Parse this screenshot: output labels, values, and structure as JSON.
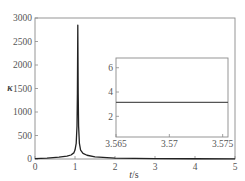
{
  "chart_data": [
    {
      "type": "line",
      "role": "main",
      "title": "",
      "xlabel_italic": "t",
      "xlabel_unit": "/s",
      "xlabel": "t/s",
      "ylabel": "κ",
      "xlim": [
        0,
        5
      ],
      "ylim": [
        0,
        3000
      ],
      "xticks": [
        0,
        1,
        2,
        3,
        4,
        5
      ],
      "xtick_labels": [
        "0",
        "1",
        "2",
        "3",
        "4",
        "5"
      ],
      "yticks": [
        0,
        500,
        1000,
        1500,
        2000,
        2500,
        3000
      ],
      "ytick_labels": [
        "0",
        "500",
        "1000",
        "1500",
        "2000",
        "2500",
        "3000"
      ],
      "grid": false,
      "legend": null,
      "series": [
        {
          "name": "kappa",
          "color": "#222222",
          "x": [
            0,
            0.3,
            0.6,
            0.8,
            0.9,
            0.97,
            1.0,
            1.03,
            1.05,
            1.06,
            1.07,
            1.08,
            1.09,
            1.11,
            1.14,
            1.2,
            1.3,
            1.5,
            2.0,
            2.5,
            3.0,
            4.0,
            5.0
          ],
          "y": [
            10,
            20,
            40,
            60,
            85,
            130,
            190,
            330,
            700,
            1400,
            2850,
            1400,
            700,
            330,
            190,
            120,
            80,
            45,
            20,
            12,
            8,
            5,
            4
          ]
        }
      ]
    },
    {
      "type": "line",
      "role": "inset",
      "title": "",
      "xlabel": "",
      "ylabel": "",
      "xlim": [
        3.565,
        3.5755
      ],
      "ylim": [
        0.3,
        6.8
      ],
      "xticks": [
        3.565,
        3.57,
        3.575
      ],
      "xtick_labels": [
        "3.565",
        "3.57",
        "3.575"
      ],
      "yticks": [
        2,
        4,
        6
      ],
      "ytick_labels": [
        "2",
        "4",
        "6"
      ],
      "grid": false,
      "legend": null,
      "series": [
        {
          "name": "kappa (zoom)",
          "color": "#555555",
          "x": [
            3.565,
            3.5755
          ],
          "y": [
            3.15,
            3.15
          ]
        }
      ]
    }
  ]
}
